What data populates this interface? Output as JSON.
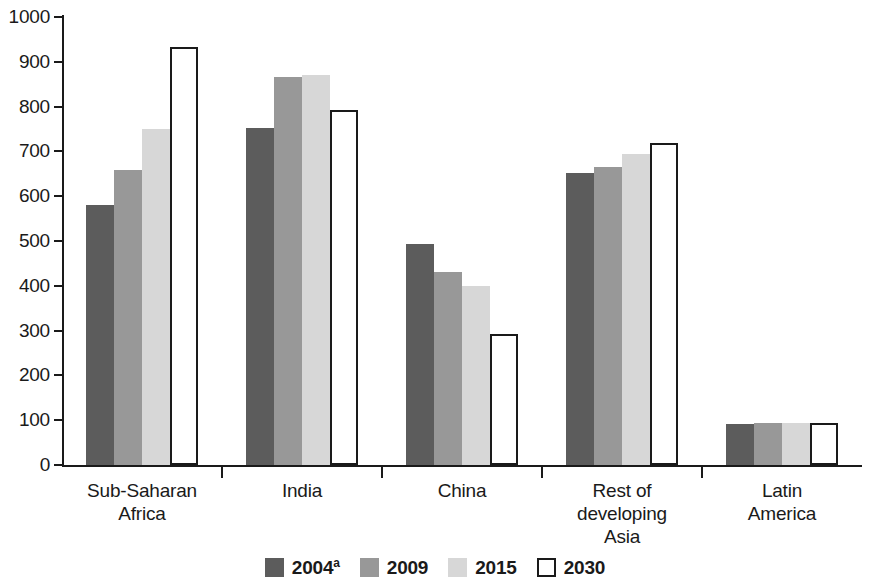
{
  "chart_data": {
    "type": "bar",
    "title": "",
    "subtitle": "",
    "xlabel": "",
    "ylabel": "",
    "ylim": [
      0,
      1000
    ],
    "ytick_values": [
      0,
      100,
      200,
      300,
      400,
      500,
      600,
      700,
      800,
      900,
      1000
    ],
    "ytick_labels": [
      "0",
      "100",
      "200",
      "300",
      "400",
      "500",
      "600",
      "700",
      "800",
      "900",
      "1000"
    ],
    "grid": false,
    "legend_position": "bottom-center",
    "categories": [
      "Sub-Saharan\nAfrica",
      "India",
      "China",
      "Rest of\ndeveloping\nAsia",
      "Latin\nAmerica"
    ],
    "category_lines": [
      [
        "Sub-Saharan",
        "Africa"
      ],
      [
        "India"
      ],
      [
        "China"
      ],
      [
        "Rest of",
        "developing",
        "Asia"
      ],
      [
        "Latin",
        "America"
      ]
    ],
    "series": [
      {
        "name": "2004",
        "name_superscript": "a",
        "color": "#5c5c5c",
        "values": [
          581,
          752,
          493,
          652,
          92
        ]
      },
      {
        "name": "2009",
        "name_superscript": "",
        "color": "#989898",
        "values": [
          659,
          867,
          431,
          665,
          93
        ]
      },
      {
        "name": "2015",
        "name_superscript": "",
        "color": "#d7d7d7",
        "values": [
          750,
          871,
          400,
          694,
          93
        ]
      },
      {
        "name": "2030",
        "name_superscript": "",
        "color": "#ffffff",
        "values": [
          932,
          793,
          292,
          718,
          94
        ]
      }
    ]
  },
  "legend": {
    "items": [
      {
        "label": "2004",
        "superscript": "a"
      },
      {
        "label": "2009",
        "superscript": ""
      },
      {
        "label": "2015",
        "superscript": ""
      },
      {
        "label": "2030",
        "superscript": ""
      }
    ]
  },
  "axis": {
    "y_max": 1000,
    "y_min": 0
  },
  "colors": {
    "series_2004": "#5c5c5c",
    "series_2009": "#989898",
    "series_2015": "#d7d7d7",
    "series_2030": "#ffffff",
    "axis": "#1a1a1a",
    "background": "#ffffff"
  }
}
